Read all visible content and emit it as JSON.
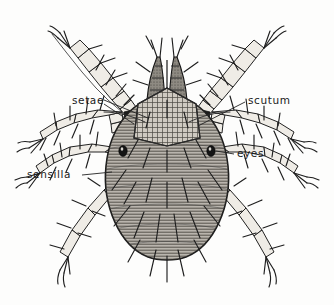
{
  "figure": {
    "view": "dorsal",
    "style": "pen-and-ink scientific illustration",
    "background_color": "#fdfdfc",
    "ink_color": "#1e1e1e",
    "body_fill_color": "#b9b5ad",
    "scutum_fill_color": "#cfcac1",
    "leg_fill_color": "#efece6",
    "coxa_color": "#1d1d1d"
  },
  "labels": [
    {
      "id": "setae",
      "text": "setae",
      "x": 72,
      "y": 104,
      "anchor": "start",
      "target": "dorsal bristles on idiosoma and legs"
    },
    {
      "id": "scutum",
      "text": "scutum",
      "x": 248,
      "y": 104,
      "anchor": "start",
      "target": "dorsal shield plate"
    },
    {
      "id": "eyes",
      "text": "eyes",
      "x": 237,
      "y": 157,
      "anchor": "start",
      "target": "lateral ocelli"
    },
    {
      "id": "sensilla",
      "text": "sensilla",
      "x": 27,
      "y": 178,
      "anchor": "start",
      "target": "sensory hairs"
    }
  ],
  "anatomy_parts": [
    "idiosoma",
    "scutum",
    "palps",
    "chelicerae",
    "eyes",
    "sensilla",
    "setae",
    "coxae",
    "legs",
    "tarsal claws"
  ],
  "leg_count": 8,
  "leg_pairs": 4
}
